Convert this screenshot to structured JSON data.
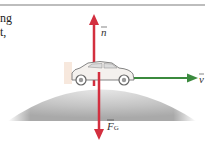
{
  "text_fragments": [
    "ng",
    "t,"
  ],
  "labels": {
    "normal": "n",
    "velocity": "v",
    "gravity": "F",
    "gravity_sub": "G"
  },
  "colors": {
    "force_arrow": "#d32f3f",
    "velocity_arrow": "#3b8a3e",
    "hill": "#b8b8b8"
  }
}
